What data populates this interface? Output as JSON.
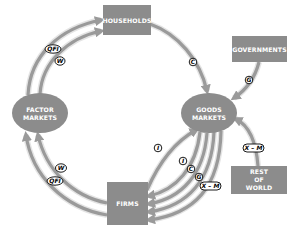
{
  "diagram": {
    "colors": {
      "node_fill": "#8c8c8c",
      "arrow": "#9a9a9a",
      "arrow_halo": "#e4e4e4",
      "node_text": "#ffffff",
      "tag_fill": "#ffffff",
      "tag_stroke": "#000000"
    },
    "nodes": {
      "households": {
        "label": "HOUSEHOLDS",
        "shape": "rect"
      },
      "governments": {
        "label": "GOVERNMENTS",
        "shape": "rect"
      },
      "factor_markets": {
        "line1": "FACTOR",
        "line2": "MARKETS",
        "shape": "ellipse"
      },
      "goods_markets": {
        "line1": "GOODS",
        "line2": "MARKETS",
        "shape": "ellipse"
      },
      "firms": {
        "label": "FIRMS",
        "shape": "rect"
      },
      "rest_of_world": {
        "line1": "REST",
        "line2": "OF",
        "line3": "WORLD",
        "shape": "rect"
      }
    },
    "flows": [
      {
        "from": "factor_markets",
        "to": "households",
        "label": "QFI"
      },
      {
        "from": "factor_markets",
        "to": "households",
        "label": "W"
      },
      {
        "from": "households",
        "to": "goods_markets",
        "label": "C"
      },
      {
        "from": "governments",
        "to": "goods_markets",
        "label": "G"
      },
      {
        "from": "goods_markets",
        "to": "firms",
        "label": "I"
      },
      {
        "from": "firms",
        "to": "goods_markets",
        "label": "I"
      },
      {
        "from": "goods_markets",
        "to": "firms",
        "label": "C"
      },
      {
        "from": "goods_markets",
        "to": "firms",
        "label": "G"
      },
      {
        "from": "goods_markets",
        "to": "firms",
        "label": "X – M"
      },
      {
        "from": "rest_of_world",
        "to": "goods_markets",
        "label": "X – M"
      },
      {
        "from": "firms",
        "to": "factor_markets",
        "label": "W"
      },
      {
        "from": "firms",
        "to": "factor_markets",
        "label": "QFI"
      }
    ]
  }
}
